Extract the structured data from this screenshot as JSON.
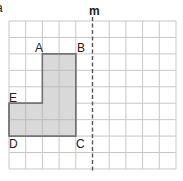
{
  "figure": {
    "corner_mark": "a",
    "grid": {
      "columns": 10,
      "rows": 9,
      "left": 9,
      "top": 21,
      "cell_w": 16.7,
      "cell_h": 16.44,
      "line_color": "#c8c8c8"
    },
    "mirror_line": {
      "label": "m",
      "column": 5,
      "style": "dashed",
      "color": "#555555"
    },
    "shape": {
      "fill": "#d9d9d9",
      "stroke": "#707070",
      "vertices": [
        {
          "label": "A",
          "col": 2,
          "row": 2
        },
        {
          "label": "B",
          "col": 4,
          "row": 2
        },
        {
          "label": "C",
          "col": 4,
          "row": 7
        },
        {
          "label": "D",
          "col": 0,
          "row": 7
        },
        {
          "label": "E",
          "col": 0,
          "row": 5
        },
        {
          "label": "",
          "col": 2,
          "row": 5
        }
      ]
    },
    "labels": {
      "A": "A",
      "B": "B",
      "C": "C",
      "D": "D",
      "E": "E",
      "m": "m"
    }
  }
}
